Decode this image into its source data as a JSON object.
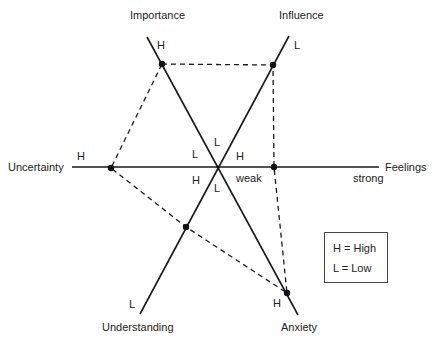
{
  "diagram": {
    "axes": {
      "importance": {
        "label": "Importance",
        "end_label": "H"
      },
      "influence": {
        "label": "Influence",
        "end_label": "L"
      },
      "uncertainty": {
        "label": "Uncertainty",
        "end_label": "H"
      },
      "feelings": {
        "label": "Feelings",
        "end_label": "strong"
      },
      "understanding": {
        "label": "Understanding",
        "end_label": "L"
      },
      "anxiety": {
        "label": "Anxiety",
        "end_label": "H"
      }
    },
    "center_labels": {
      "top": "L",
      "upper_left": "L",
      "upper_right": "H",
      "lower_left": "H",
      "lower_right_weak": "weak",
      "bottom": "L"
    },
    "legend": {
      "high": "H = High",
      "low": "L = Low"
    },
    "colors": {
      "line": "#1a1a1a",
      "text": "#222222",
      "background": "#ffffff"
    }
  }
}
